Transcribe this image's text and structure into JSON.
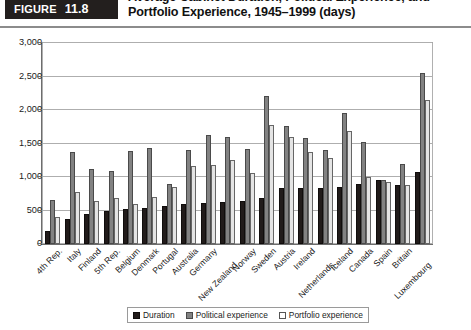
{
  "figure": {
    "word": "Figure",
    "number": "11.8",
    "title_line1": "Average Cabinet Duration, Political Experience, and",
    "title_line2": "Portfolio Experience, 1945–1999 (days)"
  },
  "legend": {
    "position": "bottom-center",
    "items": [
      {
        "label": "Duration",
        "color": "#211b1a",
        "key": "duration"
      },
      {
        "label": "Political experience",
        "color": "#828282",
        "key": "political"
      },
      {
        "label": "Portfolio experience",
        "color": "#ffffff",
        "key": "portfolio"
      }
    ]
  },
  "chart_data": {
    "type": "bar",
    "title": "Average Cabinet Duration, Political Experience, and Portfolio Experience, 1945–1999 (days)",
    "xlabel": "",
    "ylabel": "",
    "ylim": [
      0,
      3000
    ],
    "yticks": [
      0,
      500,
      1000,
      1500,
      2000,
      2500,
      3000
    ],
    "ytick_labels": [
      "0",
      "500",
      "1,000",
      "1,500",
      "2,000",
      "2,500",
      "3,000"
    ],
    "grid": true,
    "grouped": true,
    "categories": [
      "4th Rep.",
      "Italy",
      "Finland",
      "5th Rep.",
      "Belgium",
      "Denmark",
      "Portugal",
      "Australia",
      "Germany",
      "New Zealand",
      "Norway",
      "Sweden",
      "Austria",
      "Ireland",
      "Netherlands",
      "Iceland",
      "Canada",
      "Spain",
      "Britain",
      "Luxembourg"
    ],
    "series": [
      {
        "name": "Duration",
        "color": "#211b1a",
        "values": [
          190,
          370,
          450,
          490,
          520,
          545,
          560,
          600,
          610,
          625,
          640,
          680,
          840,
          840,
          840,
          845,
          900,
          960,
          880,
          1070
        ]
      },
      {
        "name": "Political experience",
        "color": "#828282",
        "values": [
          650,
          1370,
          1120,
          1090,
          1390,
          1440,
          900,
          1400,
          1620,
          1600,
          1420,
          2210,
          1760,
          1580,
          1400,
          1960,
          1520,
          950,
          1200,
          2550
        ]
      },
      {
        "name": "Portfolio experience",
        "color": "#e4e4e4",
        "values": [
          410,
          770,
          640,
          680,
          600,
          700,
          850,
          1160,
          1180,
          1250,
          1060,
          1780,
          1590,
          1370,
          1290,
          1680,
          1000,
          930,
          880,
          2150
        ]
      }
    ]
  }
}
